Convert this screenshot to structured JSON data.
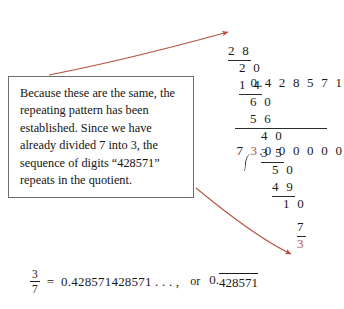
{
  "figure": {
    "type": "long-division-worked-example",
    "accent_color": "#b4523f",
    "ink_color": "#1a1a1a"
  },
  "division": {
    "quotient": "0.4 2 8 5 7 1",
    "divisor": "7",
    "dividend_whole": "3",
    "dividend_rest": ".0 0 0 0 0 0",
    "steps": [
      {
        "value": "2 8",
        "ruled": true
      },
      {
        "value": "2 0",
        "ruled": false
      },
      {
        "value": "1 4",
        "ruled": true
      },
      {
        "value": "6 0",
        "ruled": false
      },
      {
        "value": "5 6",
        "ruled": true
      },
      {
        "value": "4 0",
        "ruled": false
      },
      {
        "value": "3 5",
        "ruled": true
      },
      {
        "value": "5 0",
        "ruled": false
      },
      {
        "value": "4 9",
        "ruled": true
      },
      {
        "value": "1 0",
        "ruled": false
      },
      {
        "value": "7",
        "ruled": true
      }
    ],
    "final_remainder": "3"
  },
  "callout": {
    "text": "Because these are the same, the repeating pattern has been established. Since we have already divided 7 into 3, the sequence of digits “428571” repeats in the quotient."
  },
  "equation": {
    "numerator": "3",
    "denominator": "7",
    "equals": "=",
    "decimal_expansion": "0.428571428571 . . . ,",
    "or_label": "or",
    "repeating_prefix": "0.",
    "repeating_digits": "428571"
  }
}
